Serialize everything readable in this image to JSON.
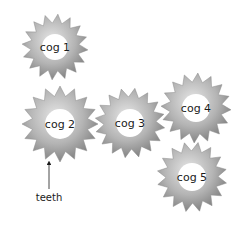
{
  "diagram": {
    "type": "gear-train",
    "background": "#ffffff",
    "gear_colors": {
      "light": "#e6e6e6",
      "mid": "#b4b4b4",
      "dark": "#7a7a7a",
      "hole": "#ffffff"
    },
    "cogs": [
      {
        "id": "cog1",
        "label": "cog 1",
        "cx": 55,
        "cy": 47,
        "r_outer": 33,
        "r_root": 24,
        "r_hole": 13,
        "teeth": 16,
        "rotation": 5
      },
      {
        "id": "cog2",
        "label": "cog 2",
        "cx": 60,
        "cy": 124,
        "r_outer": 38,
        "r_root": 28,
        "r_hole": 15,
        "teeth": 16,
        "rotation": 0
      },
      {
        "id": "cog3",
        "label": "cog 3",
        "cx": 130,
        "cy": 123,
        "r_outer": 35,
        "r_root": 26,
        "r_hole": 14,
        "teeth": 16,
        "rotation": 8
      },
      {
        "id": "cog4",
        "label": "cog 4",
        "cx": 196,
        "cy": 108,
        "r_outer": 35,
        "r_root": 26,
        "r_hole": 14,
        "teeth": 16,
        "rotation": 3
      },
      {
        "id": "cog5",
        "label": "cog 5",
        "cx": 192,
        "cy": 177,
        "r_outer": 35,
        "r_root": 26,
        "r_hole": 14,
        "teeth": 16,
        "rotation": 10
      }
    ],
    "annotation": {
      "label": "teeth",
      "arrow": {
        "x1": 49,
        "y1": 189,
        "x2": 49,
        "y2": 163
      },
      "text_x": 49,
      "text_y": 201
    }
  }
}
